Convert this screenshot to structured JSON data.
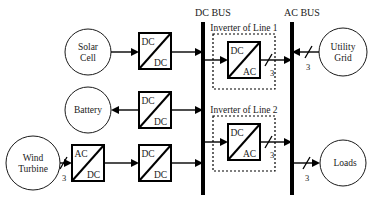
{
  "diagram": {
    "buses": {
      "dc": {
        "label": "DC BUS",
        "x": 203
      },
      "ac": {
        "label": "AC BUS",
        "x": 292
      }
    },
    "sources": [
      {
        "id": "solar-cell",
        "label_line1": "Solar",
        "label_line2": "Cell",
        "cx": 88,
        "cy": 52,
        "r": 23
      },
      {
        "id": "battery",
        "label_line1": "Battery",
        "label_line2": "",
        "cx": 88,
        "cy": 110,
        "r": 23
      },
      {
        "id": "wind-turbine",
        "label_line1": "Wind",
        "label_line2": "Turbine",
        "cx": 33,
        "cy": 163,
        "r": 27
      }
    ],
    "sinks": [
      {
        "id": "utility-grid",
        "label_line1": "Utility",
        "label_line2": "Grid",
        "cx": 343,
        "cy": 52,
        "r": 24
      },
      {
        "id": "loads",
        "label_line1": "Loads",
        "label_line2": "",
        "cx": 343,
        "cy": 163,
        "r": 23
      }
    ],
    "converters": [
      {
        "id": "solar-dc-dc",
        "top": "DC",
        "bottom": "DC",
        "x": 139,
        "y": 33,
        "w": 32,
        "h": 36
      },
      {
        "id": "battery-dc-dc",
        "top": "DC",
        "bottom": "DC",
        "x": 139,
        "y": 92,
        "w": 32,
        "h": 36
      },
      {
        "id": "wind-ac-dc",
        "top": "AC",
        "bottom": "DC",
        "x": 72,
        "y": 145,
        "w": 32,
        "h": 36
      },
      {
        "id": "wind-dc-dc",
        "top": "DC",
        "bottom": "DC",
        "x": 139,
        "y": 145,
        "w": 32,
        "h": 36
      },
      {
        "id": "inverter-line-1",
        "top": "DC",
        "bottom": "AC",
        "x": 228,
        "y": 42,
        "w": 32,
        "h": 36
      },
      {
        "id": "inverter-line-2",
        "top": "DC",
        "bottom": "AC",
        "x": 228,
        "y": 124,
        "w": 32,
        "h": 36
      }
    ],
    "groups": [
      {
        "id": "inverter-of-line-1",
        "label": "Inverter of Line 1",
        "x": 213,
        "y": 34,
        "w": 62,
        "h": 55,
        "label_x": 244,
        "label_y": 30
      },
      {
        "id": "inverter-of-line-2",
        "label": "Inverter of Line 2",
        "x": 213,
        "y": 116,
        "w": 62,
        "h": 55,
        "label_x": 244,
        "label_y": 112
      }
    ],
    "phase_markers": [
      {
        "id": "phase-wind-turbine",
        "label": "3",
        "x": 63,
        "y": 172
      },
      {
        "id": "phase-inverter-1-out",
        "label": "3",
        "x": 272,
        "y": 74
      },
      {
        "id": "phase-utility-grid",
        "label": "3",
        "x": 309,
        "y": 70
      },
      {
        "id": "phase-inverter-2-out",
        "label": "3",
        "x": 272,
        "y": 156
      },
      {
        "id": "phase-loads",
        "label": "3",
        "x": 309,
        "y": 176
      }
    ]
  }
}
